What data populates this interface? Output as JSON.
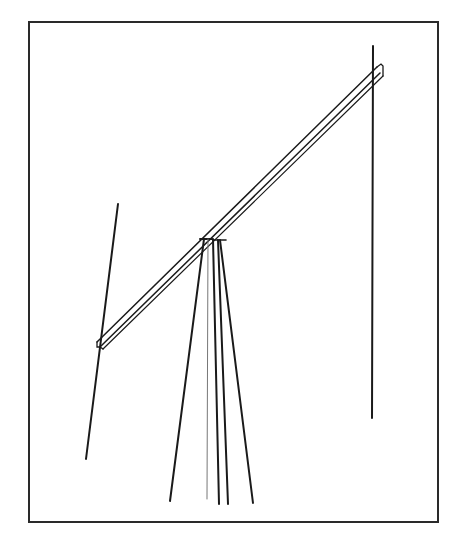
{
  "diagram": {
    "type": "line-drawing",
    "colors": {
      "stroke": "#1a1a1a",
      "frame": "#2a2a2a",
      "background": "#ffffff",
      "thin_wire": "#777777"
    },
    "boom": {
      "from": [
        99,
        345
      ],
      "to": [
        381,
        70
      ]
    },
    "elements": [
      {
        "name": "left-element",
        "from": [
          118,
          204
        ],
        "to": [
          86,
          459
        ]
      },
      {
        "name": "right-element",
        "from": [
          373,
          46
        ],
        "to": [
          372,
          418
        ]
      }
    ],
    "mast_and_guys": [
      {
        "name": "guy-left",
        "from": [
          204,
          239
        ],
        "to": [
          170,
          501
        ]
      },
      {
        "name": "mast-thin",
        "from": [
          208,
          239
        ],
        "to": [
          207,
          499
        ]
      },
      {
        "name": "mast-left",
        "from": [
          213,
          239
        ],
        "to": [
          219,
          504
        ]
      },
      {
        "name": "mast-right",
        "from": [
          218,
          240
        ],
        "to": [
          228,
          504
        ]
      },
      {
        "name": "guy-right",
        "from": [
          220,
          240
        ],
        "to": [
          253,
          503
        ]
      }
    ]
  }
}
